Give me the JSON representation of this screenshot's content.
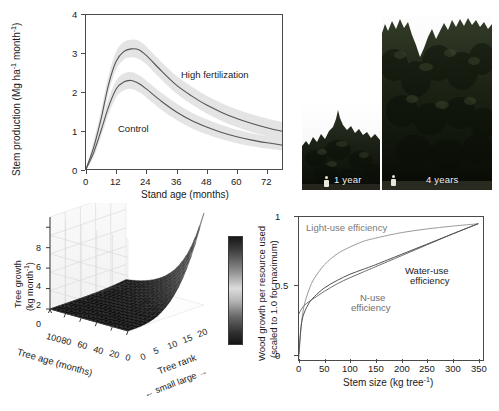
{
  "figure": {
    "panels": [
      "stem-production-chart",
      "tree-photos",
      "tree-growth-surface",
      "resource-efficiency-chart"
    ]
  },
  "stem_panel": {
    "annotations": {
      "high": "High fertilization",
      "control": "Control"
    }
  },
  "photos": {
    "items": [
      {
        "caption": "1 year",
        "age_years": 1
      },
      {
        "caption": "4 years",
        "age_years": 4
      }
    ]
  },
  "surface_panel": {
    "zlabel_line1": "Tree growth",
    "zlabel_line2": "(kg month",
    "zlabel_sup": "-1",
    "zlabel_tail": ")",
    "xlabel": "Tree age (months)",
    "ylabel": "Tree rank",
    "rank_scale": "small           large",
    "arrow_left": "←",
    "arrow_right": "→"
  },
  "eff_panel": {
    "labels": {
      "light": "Light-use efficiency",
      "nuse_l1": "N-use",
      "nuse_l2": "efficiency",
      "water_l1": "Water-use",
      "water_l2": "efficiency"
    },
    "ylabel_l1": "Wood growth per resource used",
    "ylabel_l2": "(scaled to 1.0 for maximum)"
  },
  "colors": {
    "axis": "#4a4a4a",
    "curve": "#555555",
    "band": "#e3e3e3",
    "text": "#1a1a1a"
  },
  "chart_data": [
    {
      "id": "stem-production",
      "type": "line",
      "title": "",
      "xlabel": "Stand age (months)",
      "ylabel": "Stem production (Mg ha-1 month-1)",
      "ylabel_parts": {
        "pre": "Stem production (Mg ha",
        "sup1": "-1",
        "mid": " month",
        "sup2": "-1",
        "post": ")"
      },
      "xlim": [
        0,
        78
      ],
      "ylim": [
        0,
        4
      ],
      "xticks": [
        0,
        12,
        24,
        36,
        48,
        60,
        72
      ],
      "yticks": [
        0,
        1,
        2,
        3,
        4
      ],
      "grid": false,
      "legend": "inline-annotations",
      "series": [
        {
          "name": "High fertilization",
          "x": [
            0,
            3,
            6,
            9,
            12,
            15,
            18,
            21,
            24,
            30,
            36,
            42,
            48,
            54,
            60,
            66,
            72,
            78
          ],
          "values": [
            0.0,
            0.55,
            1.3,
            2.2,
            2.8,
            3.05,
            3.12,
            3.1,
            2.95,
            2.55,
            2.18,
            1.9,
            1.66,
            1.47,
            1.31,
            1.18,
            1.07,
            0.98
          ],
          "band_lower": [
            0.0,
            0.4,
            1.1,
            1.98,
            2.58,
            2.84,
            2.9,
            2.86,
            2.72,
            2.32,
            1.96,
            1.68,
            1.44,
            1.25,
            1.09,
            0.96,
            0.85,
            0.76
          ],
          "band_upper": [
            0.0,
            0.72,
            1.52,
            2.44,
            3.05,
            3.3,
            3.36,
            3.33,
            3.18,
            2.78,
            2.42,
            2.14,
            1.9,
            1.71,
            1.55,
            1.42,
            1.31,
            1.22
          ]
        },
        {
          "name": "Control",
          "x": [
            0,
            3,
            6,
            9,
            12,
            15,
            18,
            21,
            24,
            30,
            36,
            42,
            48,
            54,
            60,
            66,
            72,
            78
          ],
          "values": [
            0.0,
            0.42,
            1.0,
            1.62,
            2.08,
            2.26,
            2.3,
            2.22,
            2.08,
            1.76,
            1.48,
            1.26,
            1.09,
            0.95,
            0.84,
            0.75,
            0.68,
            0.62
          ],
          "band_lower": [
            0.0,
            0.3,
            0.84,
            1.42,
            1.86,
            2.04,
            2.08,
            2.0,
            1.86,
            1.54,
            1.27,
            1.06,
            0.9,
            0.77,
            0.67,
            0.59,
            0.53,
            0.48
          ],
          "band_upper": [
            0.0,
            0.55,
            1.18,
            1.84,
            2.3,
            2.48,
            2.52,
            2.44,
            2.3,
            1.98,
            1.7,
            1.47,
            1.29,
            1.14,
            1.02,
            0.93,
            0.85,
            0.79
          ]
        }
      ]
    },
    {
      "id": "tree-growth-surface",
      "type": "surface",
      "xlabel": "Tree age (months)",
      "ylabel": "Tree rank",
      "zlabel": "Tree growth (kg month-1)",
      "xticks": [
        100,
        80,
        60,
        40,
        20,
        0
      ],
      "yticks": [
        0,
        5,
        10,
        15,
        20
      ],
      "zticks": [
        0,
        2,
        4,
        6,
        8
      ],
      "zlim": [
        0,
        9
      ],
      "colormap": "gray",
      "description": "Tree growth increases steeply for the largest tree ranks at young ages; near-zero for small ranks and old ages.",
      "colorbar": {
        "present": true,
        "orientation": "vertical"
      }
    },
    {
      "id": "resource-use-efficiency",
      "type": "line",
      "xlabel": "Stem size (kg tree-1)",
      "ylabel": "Wood growth per resource used (scaled to 1.0 for maximum)",
      "xlim": [
        0,
        360
      ],
      "ylim": [
        0,
        1.05
      ],
      "xticks": [
        0,
        50,
        100,
        150,
        200,
        250,
        300,
        350
      ],
      "yticks": [
        0.0,
        0.5,
        1.0
      ],
      "grid": false,
      "series": [
        {
          "name": "Light-use efficiency",
          "x": [
            0,
            2,
            5,
            10,
            20,
            30,
            50,
            75,
            100,
            125,
            150,
            200,
            250,
            300,
            350
          ],
          "values": [
            0.02,
            0.14,
            0.28,
            0.4,
            0.52,
            0.6,
            0.7,
            0.78,
            0.83,
            0.87,
            0.895,
            0.935,
            0.962,
            0.983,
            1.0
          ]
        },
        {
          "name": "N-use efficiency",
          "x": [
            0,
            2,
            5,
            10,
            20,
            30,
            50,
            75,
            100,
            125,
            150,
            200,
            250,
            300,
            350
          ],
          "values": [
            0.34,
            0.355,
            0.375,
            0.4,
            0.43,
            0.455,
            0.505,
            0.56,
            0.605,
            0.645,
            0.685,
            0.765,
            0.845,
            0.925,
            1.0
          ]
        },
        {
          "name": "Water-use efficiency",
          "x": [
            0,
            2,
            5,
            10,
            20,
            30,
            50,
            75,
            100,
            125,
            150,
            200,
            250,
            300,
            350
          ],
          "values": [
            0.05,
            0.16,
            0.27,
            0.345,
            0.42,
            0.465,
            0.53,
            0.585,
            0.63,
            0.665,
            0.7,
            0.775,
            0.85,
            0.925,
            1.0
          ]
        }
      ]
    }
  ]
}
